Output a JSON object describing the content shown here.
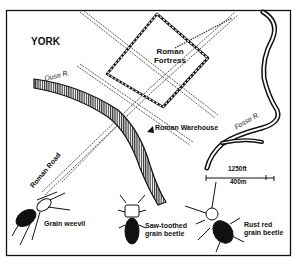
{
  "map": {
    "title": "YORK",
    "labels": {
      "fortress_line1": "Roman",
      "fortress_line2": "Fortress",
      "warehouse": "Roman Warehouse",
      "ouse_river": "Ouse R.",
      "fosse_river": "Fosse R.",
      "roman_road": "Roman Road"
    },
    "scale": {
      "feet": "1250ft",
      "meters": "400m"
    },
    "insects": [
      {
        "name": "Grain weevil",
        "line1": "Grain weevil",
        "line2": ""
      },
      {
        "name": "Saw-toothed grain beetle",
        "line1": "Saw-toothed",
        "line2": "grain beetle"
      },
      {
        "name": "Rust red grain beetle",
        "line1": "Rust red",
        "line2": "grain beetle"
      }
    ],
    "colors": {
      "ink": "#111111",
      "background": "#ffffff"
    }
  }
}
